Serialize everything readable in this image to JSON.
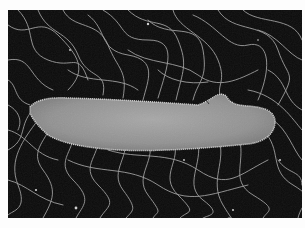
{
  "image": {
    "subject": "Scanning electron micrograph of a rod-shaped bacterium with numerous peritrichous flagella",
    "colors": {
      "background": "#0a0a0a",
      "border": "#fdfdfd",
      "cell_body": "#9a9a9a",
      "cell_edge": "#c8c8c8",
      "flagella": "#bdbdbd"
    }
  }
}
